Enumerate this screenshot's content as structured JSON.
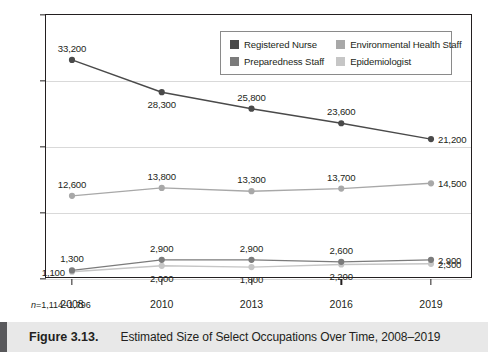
{
  "figure": {
    "caption_number": "Figure 3.13.",
    "caption_title": "Estimated Size of Select Occupations Over Time, 2008–2019",
    "footnote_prefix": "n",
    "footnote_value": "=1,114–1,796"
  },
  "legend": {
    "entries": [
      {
        "label": "Registered Nurse",
        "color": "#4a4a4a"
      },
      {
        "label": "Environmental Health Staff",
        "color": "#a8a8a8"
      },
      {
        "label": "Preparedness Staff",
        "color": "#7b7b7b"
      },
      {
        "label": "Epidemiologist",
        "color": "#c6c6c6"
      }
    ]
  },
  "chart_data": {
    "type": "line",
    "title": "Estimated Size of Select Occupations Over Time, 2008–2019",
    "xlabel": "",
    "ylabel": "",
    "categories": [
      "2008",
      "2010",
      "2013",
      "2016",
      "2019"
    ],
    "ylim": [
      0,
      40000
    ],
    "yticks": [
      0,
      10000,
      20000,
      30000,
      40000
    ],
    "ytick_labels": [
      "0",
      "10000",
      "20000",
      "30000",
      "40000"
    ],
    "grid": true,
    "legend_position": "top-center",
    "series": [
      {
        "name": "Registered Nurse",
        "color": "#4a4a4a",
        "values": [
          33200,
          28300,
          25800,
          23600,
          21200
        ],
        "labels": [
          "33,200",
          "28,300",
          "25,800",
          "23,600",
          "21,200"
        ],
        "label_pos": [
          "above",
          "below",
          "above",
          "above",
          "right"
        ]
      },
      {
        "name": "Environmental Health Staff",
        "color": "#a8a8a8",
        "values": [
          12600,
          13800,
          13300,
          13700,
          14500
        ],
        "labels": [
          "12,600",
          "13,800",
          "13,300",
          "13,700",
          "14,500"
        ],
        "label_pos": [
          "above",
          "above",
          "above",
          "above",
          "right"
        ]
      },
      {
        "name": "Preparedness Staff",
        "color": "#7b7b7b",
        "values": [
          1300,
          2900,
          2900,
          2600,
          2900
        ],
        "labels": [
          "1,300",
          "2,900",
          "2,900",
          "2,600",
          "2,900"
        ],
        "label_pos": [
          "above",
          "above",
          "above",
          "above",
          "right"
        ]
      },
      {
        "name": "Epidemiologist",
        "color": "#c6c6c6",
        "values": [
          1100,
          2000,
          1800,
          2200,
          2300
        ],
        "labels": [
          "1,100",
          "2,000",
          "1,800",
          "2,200",
          "2,300"
        ],
        "label_pos": [
          "left",
          "below",
          "below",
          "below",
          "right"
        ]
      }
    ]
  }
}
